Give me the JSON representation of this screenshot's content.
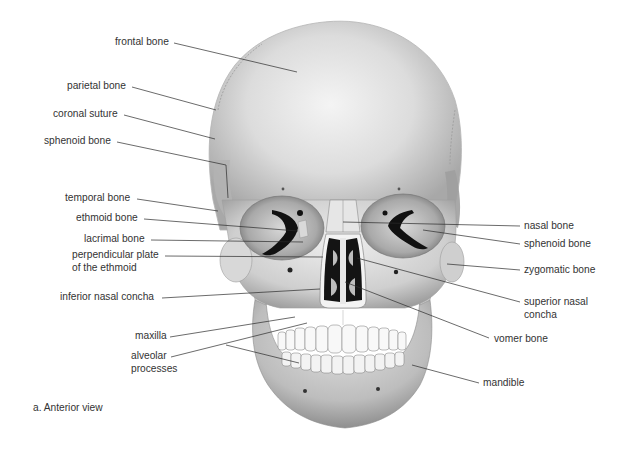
{
  "figure": {
    "caption": "a. Anterior view",
    "view": "anterior"
  },
  "labels_left": [
    {
      "id": "frontal-bone",
      "text": "frontal bone",
      "x": 115,
      "y": 36
    },
    {
      "id": "parietal-bone",
      "text": "parietal bone",
      "x": 67,
      "y": 80
    },
    {
      "id": "coronal-suture",
      "text": "coronal suture",
      "x": 53,
      "y": 108
    },
    {
      "id": "sphenoid-bone-left",
      "text": "sphenoid bone",
      "x": 44,
      "y": 135
    },
    {
      "id": "temporal-bone",
      "text": "temporal bone",
      "x": 65,
      "y": 192
    },
    {
      "id": "ethmoid-bone",
      "text": "ethmoid bone",
      "x": 76,
      "y": 212
    },
    {
      "id": "lacrimal-bone",
      "text": "lacrimal bone",
      "x": 84,
      "y": 233
    },
    {
      "id": "perpendicular-plate",
      "text": "perpendicular plate",
      "text2": "of the ethmoid",
      "x": 72,
      "y": 249
    },
    {
      "id": "inferior-nasal-concha",
      "text": "inferior nasal concha",
      "x": 60,
      "y": 291
    },
    {
      "id": "maxilla",
      "text": "maxilla",
      "x": 135,
      "y": 330
    },
    {
      "id": "alveolar-processes",
      "text": "alveolar",
      "text2": "processes",
      "x": 131,
      "y": 350
    }
  ],
  "labels_right": [
    {
      "id": "nasal-bone",
      "text": "nasal bone",
      "x": 524,
      "y": 220
    },
    {
      "id": "sphenoid-bone-right",
      "text": "sphenoid bone",
      "x": 524,
      "y": 238
    },
    {
      "id": "zygomatic-bone",
      "text": "zygomatic bone",
      "x": 524,
      "y": 264
    },
    {
      "id": "superior-nasal-concha",
      "text": "superior nasal",
      "text2": "concha",
      "x": 524,
      "y": 296
    },
    {
      "id": "vomer-bone",
      "text": "vomer bone",
      "x": 494,
      "y": 333
    },
    {
      "id": "mandible",
      "text": "mandible",
      "x": 483,
      "y": 377
    }
  ],
  "colors": {
    "bone_light": "#f2f2f2",
    "bone_mid": "#d4d4d4",
    "bone_dark": "#9a9a9a",
    "cavity": "#141414",
    "leader_line": "#2b2b2b",
    "text": "#333333"
  }
}
